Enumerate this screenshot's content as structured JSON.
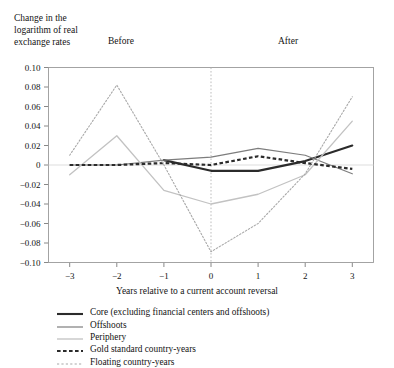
{
  "figure": {
    "y_axis_title": "Change in the\nlogarithm of real\nexchange rates",
    "period_before": "Before",
    "period_after": "After",
    "x_axis_title": "Years relative to a current account reversal"
  },
  "legend": {
    "items": [
      {
        "label": "Core (excluding financial centers and offshoots)",
        "style": "solid-thick",
        "color": "#2b2b2b",
        "icon": "legend-line-icon"
      },
      {
        "label": "Offshoots",
        "style": "solid-medium",
        "color": "#7d7d7d",
        "icon": "legend-line-icon"
      },
      {
        "label": "Periphery",
        "style": "solid-thin",
        "color": "#c2c2c2",
        "icon": "legend-line-icon"
      },
      {
        "label": "Gold standard country-years",
        "style": "dashed-thick",
        "color": "#2b2b2b",
        "icon": "legend-dash-icon"
      },
      {
        "label": "Floating country-years",
        "style": "dotted-thin",
        "color": "#a8a8a8",
        "icon": "legend-dot-icon"
      }
    ]
  },
  "chart_data": {
    "type": "line",
    "title": "",
    "xlabel": "Years relative to a current account reversal",
    "ylabel": "Change in the logarithm of real exchange rates",
    "x": [
      -3,
      -2,
      -1,
      0,
      1,
      2,
      3
    ],
    "xtick_labels": [
      "−3",
      "−2",
      "−1",
      "0",
      "1",
      "2",
      "3"
    ],
    "ytick_labels": [
      "0.10",
      "0.08",
      "0.06",
      "0.04",
      "0.02",
      "0",
      "−0.02",
      "−0.04",
      "−0.06",
      "−0.08",
      "−0.10"
    ],
    "ytick_values": [
      0.1,
      0.08,
      0.06,
      0.04,
      0.02,
      0,
      -0.02,
      -0.04,
      -0.06,
      -0.08,
      -0.1
    ],
    "xlim": [
      -3.45,
      3.45
    ],
    "ylim": [
      -0.1,
      0.1
    ],
    "grid": false,
    "zero_line": true,
    "reversal_marker_x": 0,
    "legend_position": "below",
    "series": [
      {
        "name": "Core (excluding financial centers and offshoots)",
        "values": [
          null,
          null,
          0.005,
          -0.006,
          -0.006,
          0.004,
          0.02
        ],
        "color": "#2b2b2b",
        "style": "solid",
        "width": 2.1
      },
      {
        "name": "Offshoots",
        "values": [
          0.0,
          0.0,
          0.005,
          0.008,
          0.017,
          0.01,
          -0.009
        ],
        "color": "#7d7d7d",
        "style": "solid",
        "width": 1.2
      },
      {
        "name": "Periphery",
        "values": [
          -0.01,
          0.03,
          -0.026,
          -0.04,
          -0.03,
          -0.01,
          0.045
        ],
        "color": "#c2c2c2",
        "style": "solid",
        "width": 1.3
      },
      {
        "name": "Gold standard country-years",
        "values": [
          0.0,
          0.0,
          0.002,
          0.0,
          0.009,
          0.002,
          -0.004
        ],
        "color": "#2b2b2b",
        "style": "dashed",
        "width": 2.2
      },
      {
        "name": "Floating country-years",
        "values": [
          -0.021,
          -0.021,
          -0.015,
          -0.006,
          0.004,
          0.012,
          0.02
        ],
        "color": "#2b2b2b",
        "style": "dashed",
        "width": 2.2,
        "hidden": true
      },
      {
        "name": "Floating country-years",
        "values": [
          0.01,
          0.082,
          0.0,
          -0.089,
          -0.06,
          -0.009,
          0.07
        ],
        "color": "#a8a8a8",
        "style": "dotted",
        "width": 1.1
      }
    ]
  }
}
